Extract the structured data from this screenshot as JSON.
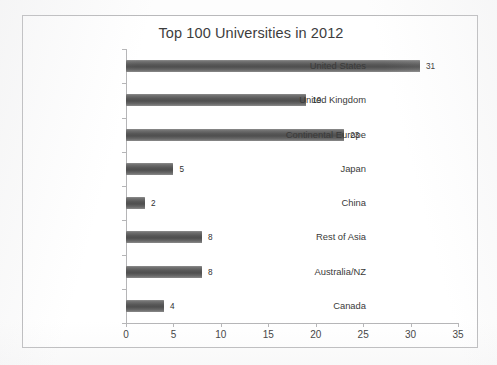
{
  "chart_data": {
    "type": "bar",
    "orientation": "horizontal",
    "title": "Top 100 Universities in 2012",
    "xlabel": "",
    "ylabel": "",
    "categories": [
      "United States",
      "United Kingdom",
      "Continental Europe",
      "Japan",
      "China",
      "Rest of Asia",
      "Australia/NZ",
      "Canada"
    ],
    "values": [
      31,
      19,
      23,
      5,
      2,
      8,
      8,
      4
    ],
    "data_labels": [
      "31",
      "19",
      "23",
      "5",
      "2",
      "8",
      "8",
      "4"
    ],
    "xlim": [
      0,
      35
    ],
    "xticks": [
      0,
      5,
      10,
      15,
      20,
      25,
      30,
      35
    ],
    "xtick_labels": [
      "0",
      "5",
      "10",
      "15",
      "20",
      "25",
      "30",
      "35"
    ],
    "grid": false,
    "legend": false,
    "legend_position": "none",
    "series": [
      {
        "name": "Top 100 Universities",
        "values": [
          31,
          19,
          23,
          5,
          2,
          8,
          8,
          4
        ]
      }
    ],
    "colors": {
      "bar": "#565656",
      "bar_highlight": "#8d8d8d",
      "axis": "#b5b5b7",
      "frame": "#b9b9bb",
      "title_text": "#3d3d3d",
      "label_text": "#3a3a3a",
      "value_text": "#2f2f2f",
      "background": "#ffffff"
    }
  }
}
